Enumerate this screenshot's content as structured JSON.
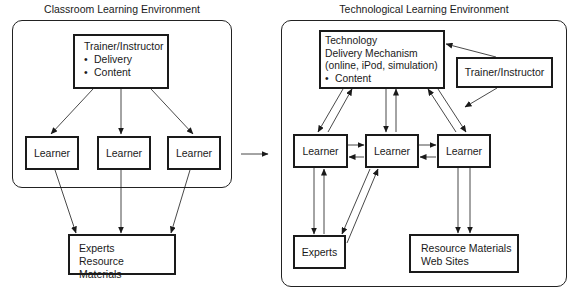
{
  "classroom": {
    "title": "Classroom Learning Environment",
    "trainer": {
      "label": "Trainer/Instructor",
      "bullets": [
        "Delivery",
        "Content"
      ]
    },
    "learners": [
      "Learner",
      "Learner",
      "Learner"
    ],
    "outside": {
      "lines": [
        "Experts",
        "Resource Materials"
      ]
    }
  },
  "technological": {
    "title": "Technological Learning Environment",
    "technology": {
      "lines": [
        "Technology",
        "Delivery Mechanism",
        "(online, iPod, simulation)"
      ],
      "bullets": [
        "Content"
      ]
    },
    "trainer": {
      "label": "Trainer/Instructor"
    },
    "learners": [
      "Learner",
      "Learner",
      "Learner"
    ],
    "experts": {
      "label": "Experts"
    },
    "resources": {
      "lines": [
        "Resource Materials",
        "Web Sites"
      ]
    }
  },
  "colors": {
    "line": "#1a1a1a",
    "background": "#ffffff"
  }
}
